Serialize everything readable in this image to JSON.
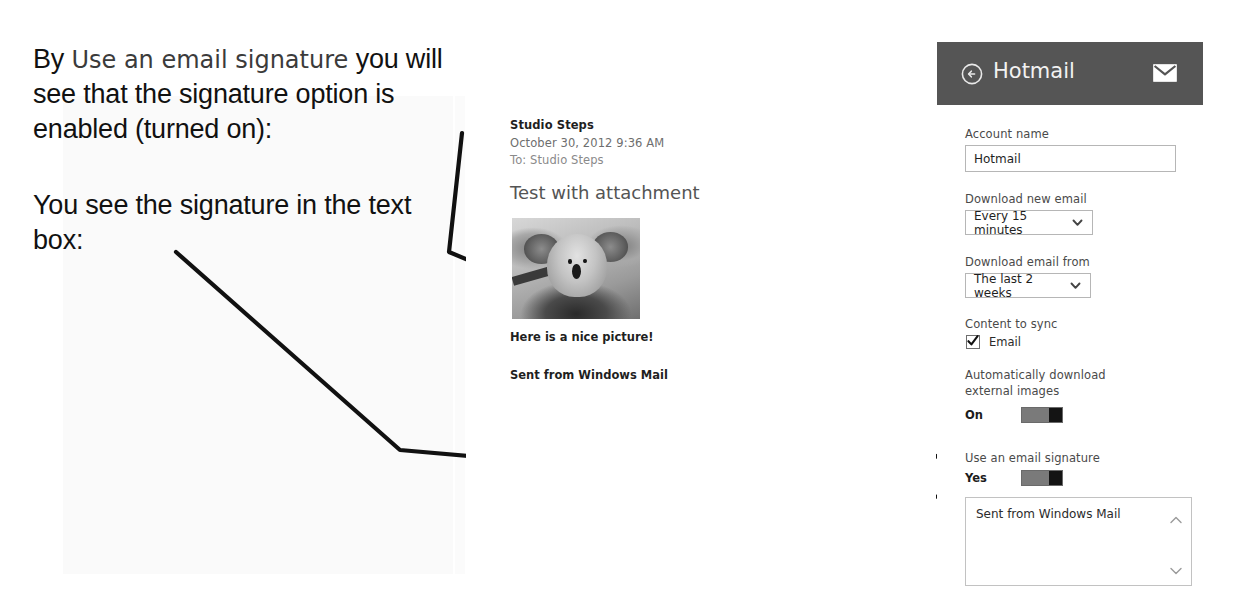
{
  "annotations": {
    "block1": {
      "lead": "By",
      "quoted_setting": "Use an email signature",
      "rest": "you will see that the signature option is enabled (turned on):"
    },
    "block2": {
      "text": "You see the signature in the text box:"
    }
  },
  "email": {
    "sender": "Studio Steps",
    "date": "October 30, 2012  9:36 AM",
    "recipient": "To: Studio Steps",
    "subject": "Test with attachment",
    "attachment_alt": "koala-photo",
    "caption": "Here is a nice picture!",
    "signature_line": "Sent from Windows Mail"
  },
  "settings": {
    "header": {
      "title": "Hotmail",
      "back_icon": "back-arrow-icon",
      "mail_icon": "envelope-icon"
    },
    "account_name": {
      "label": "Account name",
      "value": "Hotmail"
    },
    "download_new_email": {
      "label": "Download new email",
      "value": "Every 15 minutes",
      "options": [
        "Every 15 minutes"
      ]
    },
    "download_email_from": {
      "label": "Download email from",
      "value": "The last 2 weeks",
      "options": [
        "The last 2 weeks"
      ]
    },
    "content_to_sync": {
      "label": "Content to sync",
      "checkbox_label": "Email",
      "checked": true
    },
    "auto_download_images": {
      "label": "Automatically download external images",
      "state": "On",
      "enabled": true
    },
    "use_email_signature": {
      "label": "Use an email signature",
      "state": "Yes",
      "enabled": true
    },
    "signature_box": {
      "value": "Sent from Windows Mail",
      "scroll_up_icon": "chevron-up-icon",
      "scroll_down_icon": "chevron-down-icon"
    }
  },
  "colors": {
    "header_bar": "#555555",
    "page_background": "#ffffff",
    "annotation_ink": "#111111",
    "toggle_track": "#7a7a7a",
    "toggle_thumb": "#141414"
  }
}
